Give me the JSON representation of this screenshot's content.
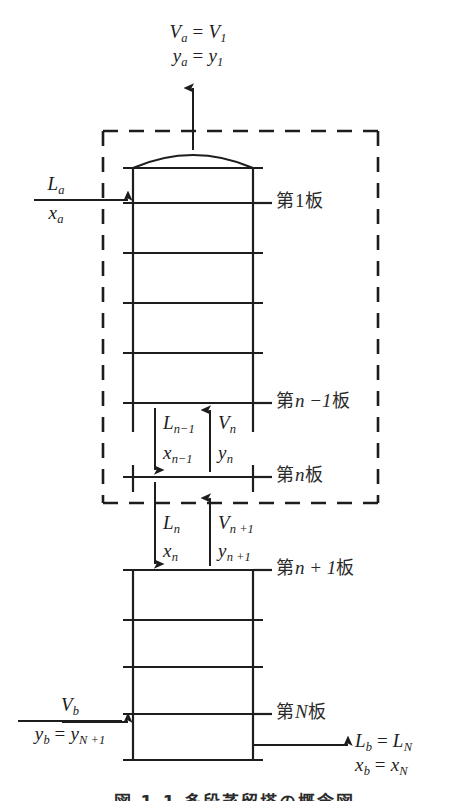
{
  "figure": {
    "title_caption": "図 1.1 多段蒸留塔の概念図",
    "domain_type": "process-flow-diagram",
    "line_color": "#1d1d1d",
    "text_color": "#1d1d1d",
    "background": "#ffffff"
  },
  "streams": {
    "top_vapor": {
      "line1_var": "V",
      "line1_sub": "a",
      "line1_eq": " = ",
      "line1_var2": "V",
      "line1_sub2": "1",
      "line2_var": "y",
      "line2_sub": "a",
      "line2_eq": " = ",
      "line2_var2": "y",
      "line2_sub2": "1",
      "line1_full": "Va = V1",
      "line2_full": "ya = y1",
      "direction": "up"
    },
    "top_liquid_feed": {
      "numerator_var": "L",
      "numerator_sub": "a",
      "denominator_var": "x",
      "denominator_sub": "a",
      "direction": "right"
    },
    "internal_upper": {
      "liquid_var": "L",
      "liquid_sub": "n−1",
      "liquid_comp_var": "x",
      "liquid_comp_sub": "n−1",
      "vapor_var": "V",
      "vapor_sub": "n",
      "vapor_comp_var": "y",
      "vapor_comp_sub": "n",
      "liquid_direction": "down",
      "vapor_direction": "up"
    },
    "internal_lower": {
      "liquid_var": "L",
      "liquid_sub": "n",
      "liquid_comp_var": "x",
      "liquid_comp_sub": "n",
      "vapor_var": "V",
      "vapor_sub": "n +1",
      "vapor_comp_var": "y",
      "vapor_comp_sub": "n +1",
      "liquid_direction": "down",
      "vapor_direction": "up"
    },
    "bottom_vapor_feed": {
      "numerator_var": "V",
      "numerator_sub": "b",
      "denominator_var": "y",
      "denominator_sub": "b",
      "denominator_eq": " = ",
      "denominator_var2": "y",
      "denominator_sub2": "N +1",
      "direction": "right"
    },
    "bottom_liquid_out": {
      "line1_var": "L",
      "line1_sub": "b",
      "line1_eq": " = ",
      "line1_var2": "L",
      "line1_sub2": "N",
      "line2_var": "x",
      "line2_sub": "b",
      "line2_eq": " = ",
      "line2_var2": "x",
      "line2_sub2": "N",
      "direction": "right"
    }
  },
  "tray_labels": [
    {
      "id": "tray-1",
      "prefix": "第",
      "index": "1",
      "index_style": "roman",
      "suffix": "板",
      "y": 203
    },
    {
      "id": "tray-n-1",
      "prefix": "第",
      "index": "n −1",
      "index_style": "italic",
      "suffix": "板",
      "y": 403
    },
    {
      "id": "tray-n",
      "prefix": "第",
      "index": "n",
      "index_style": "italic",
      "suffix": "板",
      "y": 477
    },
    {
      "id": "tray-n-p-1",
      "prefix": "第",
      "index": "n + 1",
      "index_style": "italic",
      "suffix": "板",
      "y": 570
    },
    {
      "id": "tray-N",
      "prefix": "第",
      "index": "N",
      "index_style": "italic",
      "suffix": "板",
      "y": 714
    }
  ],
  "geometry": {
    "column_left_x": 133,
    "column_right_x": 253,
    "tray_overhang": 10,
    "upper_column_top_y": 168,
    "upper_column_bottom_y": 432,
    "upper_trays_y": [
      203,
      253,
      303,
      353,
      403
    ],
    "middle_tray_y": 477,
    "lower_column_top_y": 570,
    "lower_column_bottom_y": 760,
    "lower_trays_y": [
      570,
      620,
      667,
      714
    ],
    "envelope_left_x": 103,
    "envelope_right_x": 378,
    "envelope_top_y": 131,
    "envelope_bottom_y": 503,
    "dome_apex_y": 152
  }
}
